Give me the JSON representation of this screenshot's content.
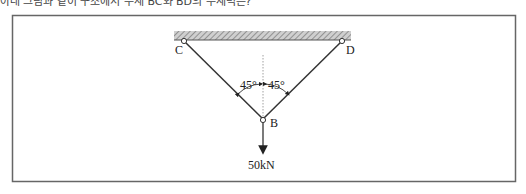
{
  "header": {
    "text": "아래 그림과 같이 구조에서 부재 BC와 BD의 부재력은?"
  },
  "diagram": {
    "labels": {
      "C": "C",
      "D": "D",
      "B": "B",
      "angle_left": "45°",
      "angle_right": "45°",
      "load": "50kN"
    },
    "colors": {
      "frame": "#666666",
      "member": "#333333",
      "support_fill": "#aaaaaa"
    }
  }
}
